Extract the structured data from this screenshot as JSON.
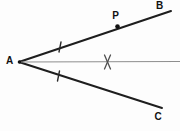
{
  "figure": {
    "background_color": "#fdfdfd",
    "ray_color": "#1e1e1e",
    "bisector_color": "#8e8e8e",
    "label_color": "#111111",
    "labels": {
      "vertex": "A",
      "upper_ray_end": "B",
      "lower_ray_end": "C",
      "point_on_upper_ray": "P"
    },
    "elements": [
      {
        "type": "line",
        "name": "ray-AB",
        "x1": 19,
        "y1": 62,
        "x2": 171,
        "y2": 11,
        "stroke": "#1e1e1e",
        "width": 2
      },
      {
        "type": "line",
        "name": "ray-AC",
        "x1": 19,
        "y1": 62,
        "x2": 162,
        "y2": 108,
        "stroke": "#1e1e1e",
        "width": 2
      },
      {
        "type": "line",
        "name": "angle-bisector-ray",
        "x1": 19,
        "y1": 62,
        "x2": 180,
        "y2": 61.5,
        "stroke": "#8e8e8e",
        "width": 1.2
      },
      {
        "type": "line",
        "name": "angle-tick-on-AB",
        "x1": 61,
        "y1": 42,
        "x2": 59,
        "y2": 52,
        "stroke": "#2a2a2a",
        "width": 1.4
      },
      {
        "type": "line",
        "name": "angle-tick-on-AC",
        "x1": 59.5,
        "y1": 71,
        "x2": 57.5,
        "y2": 81,
        "stroke": "#2a2a2a",
        "width": 1.4
      },
      {
        "type": "line",
        "name": "arc-intersection-mark-stroke-1",
        "x1": 104.5,
        "y1": 55,
        "x2": 110.5,
        "y2": 69,
        "stroke": "#4f4f4f",
        "width": 1.3
      },
      {
        "type": "line",
        "name": "arc-intersection-mark-stroke-2",
        "x1": 110.5,
        "y1": 55,
        "x2": 104.5,
        "y2": 69,
        "stroke": "#4f4f4f",
        "width": 1.3
      },
      {
        "type": "dot",
        "name": "point-A-dot",
        "cx": 19.5,
        "cy": 62,
        "r": 1.8,
        "fill": "#111111"
      },
      {
        "type": "dot",
        "name": "point-P-dot",
        "cx": 117.5,
        "cy": 26.5,
        "r": 2.3,
        "fill": "#111111"
      },
      {
        "type": "label",
        "name": "label-A",
        "bind": "vertex",
        "x": 9.5,
        "y": 60,
        "size": 10
      },
      {
        "type": "label",
        "name": "label-B",
        "bind": "upper_ray_end",
        "x": 159.5,
        "y": 5,
        "size": 10
      },
      {
        "type": "label",
        "name": "label-C",
        "bind": "lower_ray_end",
        "x": 158,
        "y": 116,
        "size": 10
      },
      {
        "type": "label",
        "name": "label-P",
        "bind": "point_on_upper_ray",
        "x": 115.5,
        "y": 15,
        "size": 10
      }
    ]
  }
}
